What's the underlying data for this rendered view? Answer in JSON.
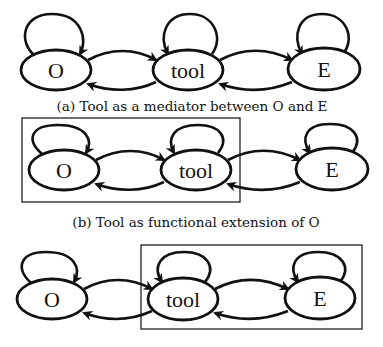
{
  "figure": {
    "panels": [
      {
        "id": "a",
        "caption": "(a) Tool as a mediator between O and E",
        "nodes": [
          {
            "label": "O",
            "cx": 56,
            "cy": 70
          },
          {
            "label": "tool",
            "cx": 188,
            "cy": 70
          },
          {
            "label": "E",
            "cx": 324,
            "cy": 69
          }
        ],
        "box": null
      },
      {
        "id": "b",
        "caption": "(b) Tool as functional extension of O",
        "nodes": [
          {
            "label": "O",
            "cx": 64,
            "cy": 170
          },
          {
            "label": "tool",
            "cx": 196,
            "cy": 170
          },
          {
            "label": "E",
            "cx": 332,
            "cy": 169
          }
        ],
        "box": {
          "encloses": [
            "O",
            "tool"
          ]
        }
      },
      {
        "id": "c",
        "caption": "",
        "nodes": [
          {
            "label": "O",
            "cx": 52,
            "cy": 299
          },
          {
            "label": "tool",
            "cx": 183,
            "cy": 299
          },
          {
            "label": "E",
            "cx": 320,
            "cy": 298
          }
        ],
        "box": {
          "encloses": [
            "tool",
            "E"
          ]
        }
      }
    ],
    "colors": {
      "stroke": "#111111",
      "background": "#ffffff"
    }
  }
}
